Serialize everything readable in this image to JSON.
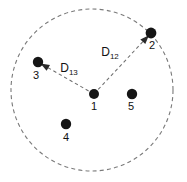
{
  "figure": {
    "background_color": "#ffffff",
    "width": 187,
    "height": 182
  },
  "chart_data": {
    "type": "scatter",
    "title": "",
    "xlabel": "",
    "ylabel": "",
    "grid": false,
    "legend": "none",
    "boundary": {
      "shape": "circle",
      "style": "dashed",
      "center_x": 92,
      "center_y": 90,
      "radius": 81,
      "color": "#7a7a7a"
    },
    "points": [
      {
        "id": "1",
        "label": "1",
        "x": 94,
        "y": 94,
        "r": 5.0,
        "label_x": 94,
        "label_y": 110,
        "color": "#151515"
      },
      {
        "id": "2",
        "label": "2",
        "x": 151,
        "y": 33,
        "r": 5.4,
        "label_x": 152,
        "label_y": 49,
        "color": "#151515"
      },
      {
        "id": "3",
        "label": "3",
        "x": 38,
        "y": 62,
        "r": 5.2,
        "label_x": 36,
        "label_y": 79,
        "color": "#151515"
      },
      {
        "id": "4",
        "label": "4",
        "x": 66,
        "y": 124,
        "r": 5.2,
        "label_x": 66,
        "label_y": 141,
        "color": "#151515"
      },
      {
        "id": "5",
        "label": "5",
        "x": 132,
        "y": 94,
        "r": 5.2,
        "label_x": 131,
        "label_y": 110,
        "color": "#151515"
      }
    ],
    "edges": [
      {
        "id": "D12",
        "from": "1",
        "to": "2",
        "label_main": "D",
        "label_sub": "12",
        "label_x": 110,
        "label_y": 56,
        "style": "dashed",
        "arrow_at": "2",
        "color": "#6f6f6f"
      },
      {
        "id": "D13",
        "from": "1",
        "to": "3",
        "label_main": "D",
        "label_sub": "13",
        "label_x": 69,
        "label_y": 72,
        "style": "dashed",
        "arrow_at": "3",
        "color": "#6f6f6f"
      }
    ]
  }
}
